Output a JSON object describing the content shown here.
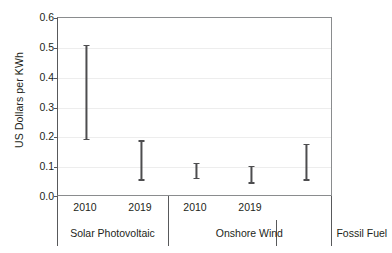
{
  "chart_data": {
    "type": "bar",
    "title": "",
    "subtitle": "",
    "xlabel": "",
    "ylabel": "US Dollars per KWh",
    "ylim": [
      0.0,
      0.6
    ],
    "yticks": [
      "0.0",
      "0.1",
      "0.2",
      "0.3",
      "0.4",
      "0.5",
      "0.6"
    ],
    "ytick_values": [
      0.0,
      0.1,
      0.2,
      0.3,
      0.4,
      0.5,
      0.6
    ],
    "grid": true,
    "legend": "none",
    "categories": [
      "Solar Photovoltaic",
      "Onshore Wind",
      "Fossil Fuel"
    ],
    "x": [
      "2010",
      "2019",
      "2010",
      "2019",
      ""
    ],
    "series": [
      {
        "name": "Cost range (low-high)",
        "points": [
          {
            "group": "Solar Photovoltaic",
            "year": "2010",
            "low": 0.19,
            "high": 0.51
          },
          {
            "group": "Solar Photovoltaic",
            "year": "2019",
            "low": 0.055,
            "high": 0.19
          },
          {
            "group": "Onshore Wind",
            "year": "2010",
            "low": 0.06,
            "high": 0.115
          },
          {
            "group": "Onshore Wind",
            "year": "2019",
            "low": 0.045,
            "high": 0.105
          },
          {
            "group": "Fossil Fuel",
            "year": "",
            "low": 0.055,
            "high": 0.177
          }
        ]
      }
    ],
    "colors": {
      "bar": "#4d4d4f",
      "axis": "#58595b",
      "grid": "#ededed",
      "background": "#ffffff",
      "text": "#231f20"
    }
  },
  "axis": {
    "y": {
      "label": "US Dollars per KWh",
      "ticks": [
        {
          "label": "0.6"
        },
        {
          "label": "0.5"
        },
        {
          "label": "0.4"
        },
        {
          "label": "0.3"
        },
        {
          "label": "0.2"
        },
        {
          "label": "0.1"
        },
        {
          "label": "0.0"
        }
      ]
    },
    "x": {
      "years": [
        {
          "label": "2010"
        },
        {
          "label": "2019"
        },
        {
          "label": "2010"
        },
        {
          "label": "2019"
        }
      ],
      "groups": [
        {
          "label": "Solar Photovoltaic"
        },
        {
          "label": "Onshore Wind"
        },
        {
          "label": "Fossil Fuel"
        }
      ]
    }
  }
}
